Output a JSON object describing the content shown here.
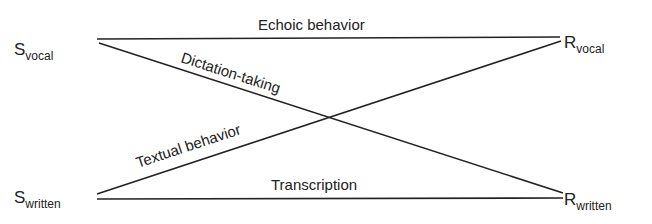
{
  "nodes": {
    "s_vocal": {
      "main": "S",
      "sub": "vocal"
    },
    "s_written": {
      "main": "S",
      "sub": "written"
    },
    "r_vocal": {
      "main": "R",
      "sub": "vocal"
    },
    "r_written": {
      "main": "R",
      "sub": "written"
    }
  },
  "edges": {
    "echoic": {
      "label": "Echoic behavior",
      "from": "S_vocal",
      "to": "R_vocal"
    },
    "dictation": {
      "label": "Dictation-taking",
      "from": "S_vocal",
      "to": "R_written"
    },
    "textual": {
      "label": "Textual behavior",
      "from": "S_written",
      "to": "R_vocal"
    },
    "transcription": {
      "label": "Transcription",
      "from": "S_written",
      "to": "R_written"
    }
  }
}
